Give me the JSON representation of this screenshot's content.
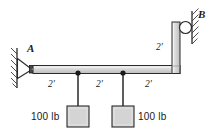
{
  "figure": {
    "type": "statics-free-body-diagram",
    "background_color": "#ffffff",
    "line_color": "#1a1a1a",
    "member_fill": "#d0d0d0",
    "block_fill": "#d4d4d4"
  },
  "supports": {
    "pin": {
      "label": "A",
      "kind": "pin-support-icon",
      "wall": "hatched-vertical-wall"
    },
    "roller": {
      "label": "B",
      "kind": "roller-support-icon",
      "wall": "hatched-inclined-wall"
    }
  },
  "dimensions": {
    "horizontal": [
      {
        "label": "2'"
      },
      {
        "label": "2'"
      },
      {
        "label": "2'"
      }
    ],
    "vertical": [
      {
        "label": "2'"
      }
    ]
  },
  "loads": [
    {
      "label": "100 lb",
      "side": "left"
    },
    {
      "label": "100 lb",
      "side": "right"
    }
  ]
}
